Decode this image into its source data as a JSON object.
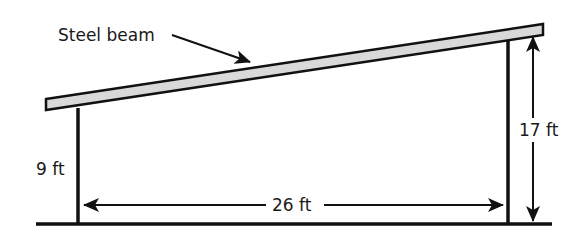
{
  "diagram": {
    "labels": {
      "beam": "Steel beam",
      "left_height": "9 ft",
      "right_height": "17 ft",
      "span": "26 ft"
    },
    "dimensions": {
      "left_post_height_ft": 9,
      "right_post_height_ft": 17,
      "horizontal_span_ft": 26
    },
    "colors": {
      "line": "#111111",
      "beam_fill": "#d9d9d9",
      "background": "#ffffff"
    }
  }
}
